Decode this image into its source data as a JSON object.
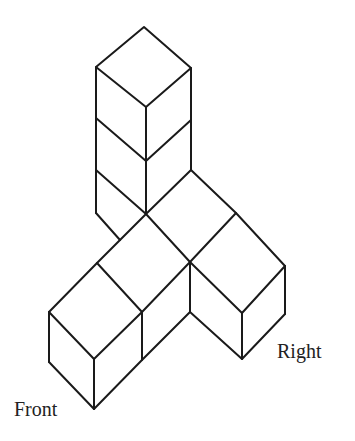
{
  "figure": {
    "labels": {
      "front": "Front",
      "right": "Right"
    },
    "colors": {
      "line": "#1a1a1a",
      "background": "#ffffff",
      "text": "#222222"
    },
    "parts": {
      "column_cube_count": 3,
      "front_arm_cube_count": 2,
      "right_arm_cube_count": 2
    }
  }
}
